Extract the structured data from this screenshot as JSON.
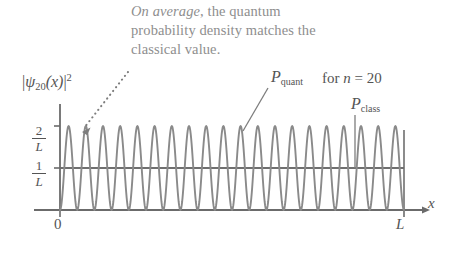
{
  "figure": {
    "callout": {
      "emphasis": "On average",
      "rest": ", the quantum probability density matches the classical value."
    },
    "y_axis_label": {
      "psi": "ψ",
      "subscript": "20",
      "argument": "(x)",
      "exponent": "2"
    },
    "y_ticks": [
      {
        "numerator": "2",
        "denominator": "L",
        "value": 2
      },
      {
        "numerator": "1",
        "denominator": "L",
        "value": 1
      }
    ],
    "x_ticks": [
      {
        "label": "0",
        "value": 0
      },
      {
        "label": "L",
        "value": 1
      }
    ],
    "x_axis_label": "x",
    "labels": {
      "p_quant": {
        "symbol": "P",
        "subscript": "quant"
      },
      "p_class": {
        "symbol": "P",
        "subscript": "class"
      },
      "n_note_prefix": "for ",
      "n_note_var": "n",
      "n_note_suffix": " = 20"
    },
    "colors": {
      "curve": "#8a8a8a",
      "classical_line": "#6f6f6f",
      "axis": "#6b6b6b",
      "text": "#545454",
      "callout_text": "#8e8e8e",
      "leader": "#7d7d7d",
      "background": "#ffffff"
    }
  },
  "chart_data": {
    "type": "line",
    "title": "",
    "xlabel": "x",
    "ylabel": "|ψ₂₀(x)|²",
    "xlim": [
      0,
      1
    ],
    "ylim": [
      0,
      2.25
    ],
    "grid": false,
    "legend": "none",
    "quantum_number_n": 20,
    "x_tick_labels": [
      "0",
      "L"
    ],
    "x_tick_values": [
      0,
      1
    ],
    "y_tick_labels": [
      "1/L",
      "2/L"
    ],
    "y_tick_values": [
      1,
      2
    ],
    "series": [
      {
        "name": "P_quant",
        "type": "line",
        "formula": "2/L * sin^2(n*pi*x/L)",
        "n": 20,
        "amplitude": 2,
        "peaks": 20,
        "samples": 801,
        "color": "#8a8a8a"
      },
      {
        "name": "P_class",
        "type": "line",
        "formula": "1/L",
        "constant": 1,
        "color": "#6f6f6f"
      }
    ],
    "annotations": [
      {
        "text": "On average, the quantum probability density matches the classical value.",
        "target": "first peak of quantum density",
        "leader": "dotted-arrow"
      },
      {
        "text": "P_quant",
        "target": "quantum density curve",
        "leader": "diagonal"
      },
      {
        "text": "P_class",
        "target": "classical constant line",
        "leader": "vertical"
      }
    ]
  },
  "geometry": {
    "origin_x": 60,
    "right_x": 404,
    "baseline_y": 210,
    "y_at_1L": 168,
    "y_at_2L": 132
  }
}
